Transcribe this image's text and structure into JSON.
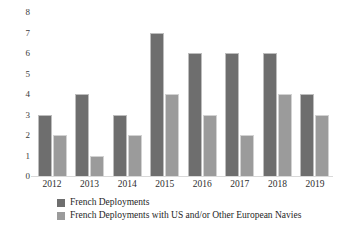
{
  "chart_data": {
    "type": "bar",
    "title": "",
    "subtitle": "",
    "xlabel": "",
    "ylabel": "",
    "categories": [
      "2012",
      "2013",
      "2014",
      "2015",
      "2016",
      "2017",
      "2018",
      "2019"
    ],
    "series": [
      {
        "name": "French Deployments",
        "color": "#6e6e6e",
        "values": [
          3,
          4,
          3,
          7,
          6,
          6,
          6,
          4
        ]
      },
      {
        "name": "French Deployments with US and/or Other European Navies",
        "color": "#9b9b9b",
        "values": [
          2,
          1,
          2,
          4,
          3,
          2,
          4,
          3
        ]
      }
    ],
    "ylim": [
      0,
      8
    ],
    "yticks": [
      "0",
      "1",
      "2",
      "3",
      "4",
      "5",
      "6",
      "7",
      "8"
    ],
    "grid": false,
    "legend_position": "bottom-left"
  },
  "colors": {
    "series_dark": "#6e6e6e",
    "series_light": "#9b9b9b",
    "background": "#ffffff",
    "tick_text": "#2e2e2e",
    "baseline": "#d9d9d9"
  }
}
